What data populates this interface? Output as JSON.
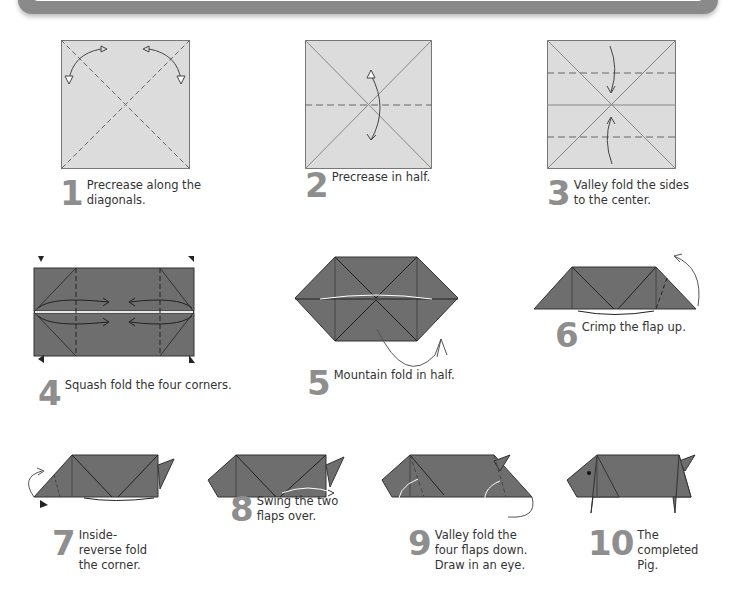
{
  "colors": {
    "paper_light": "#dcdcdc",
    "paper_dark": "#6e6e6e",
    "line": "#555555",
    "step_number": "#8e8e8e",
    "banner": "#8a8a8a"
  },
  "steps": [
    {
      "number": "1",
      "caption": "Precrease along the\ndiagonals."
    },
    {
      "number": "2",
      "caption": "Precrease in half."
    },
    {
      "number": "3",
      "caption": "Valley fold the sides\nto the center."
    },
    {
      "number": "4",
      "caption": "Squash fold the four corners."
    },
    {
      "number": "5",
      "caption": "Mountain fold in half."
    },
    {
      "number": "6",
      "caption": "Crimp the flap up."
    },
    {
      "number": "7",
      "caption": "Inside-\nreverse fold\nthe corner."
    },
    {
      "number": "8",
      "caption": "Swing the two\nflaps over."
    },
    {
      "number": "9",
      "caption": "Valley fold the\nfour flaps down.\nDraw in an eye."
    },
    {
      "number": "10",
      "caption": "The\ncompleted\nPig."
    }
  ]
}
